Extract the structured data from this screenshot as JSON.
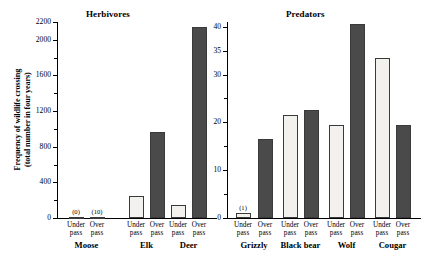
{
  "chart_data": {
    "type": "bar",
    "title": "",
    "ylabel_line1": "Frequency of wildlife crossing",
    "ylabel_line2": "(total number in four years)",
    "xlabel": "",
    "grid": false,
    "legend_position": "none",
    "panels": [
      {
        "name": "herbivores",
        "title": "Herbivores",
        "ylim": [
          0,
          2200
        ],
        "yticks_major": [
          0,
          400,
          800,
          1200,
          1600,
          2000,
          2200
        ],
        "yticks_minor": [
          200,
          600,
          1000,
          1400,
          1800
        ],
        "ytick_labels": [
          "0",
          "400",
          "800",
          "1200",
          "1600",
          "2000",
          "2200"
        ],
        "categories": [
          "Moose",
          "Elk",
          "Deer"
        ],
        "series": [
          {
            "name": "Under pass",
            "values": [
              0,
              243,
              142
            ]
          },
          {
            "name": "Over pass",
            "values": [
              10,
              963,
              2143
            ]
          }
        ],
        "annotations": [
          {
            "group": "Moose",
            "series": "Under pass",
            "text": "(0)"
          },
          {
            "group": "Moose",
            "series": "Over pass",
            "text": "(10)"
          }
        ]
      },
      {
        "name": "predators",
        "title": "Predators",
        "ylim": [
          0,
          41
        ],
        "yticks_major": [
          0,
          10,
          20,
          30,
          35,
          40
        ],
        "yticks_minor": [
          5,
          15,
          25
        ],
        "ytick_labels": [
          "0",
          "10",
          "20",
          "30",
          "35",
          "40"
        ],
        "categories": [
          "Grizzly",
          "Black bear",
          "Wolf",
          "Cougar"
        ],
        "series": [
          {
            "name": "Under pass",
            "values": [
              1,
              21.5,
              19.5,
              33.5
            ]
          },
          {
            "name": "Over pass",
            "values": [
              16.5,
              22.5,
              40.5,
              19.5
            ]
          }
        ],
        "annotations": [
          {
            "group": "Grizzly",
            "series": "Under pass",
            "text": "(1)"
          }
        ]
      }
    ],
    "bar_labels": {
      "under": "Under\npass",
      "over": "Over\npass"
    },
    "colors": {
      "under_pass_fill": "#f2f1ee",
      "over_pass_fill": "#4a4a4a",
      "axis": "#000000"
    }
  },
  "axis_labels": {
    "under_line1": "Under",
    "under_line2": "pass",
    "over_line1": "Over",
    "over_line2": "pass"
  }
}
